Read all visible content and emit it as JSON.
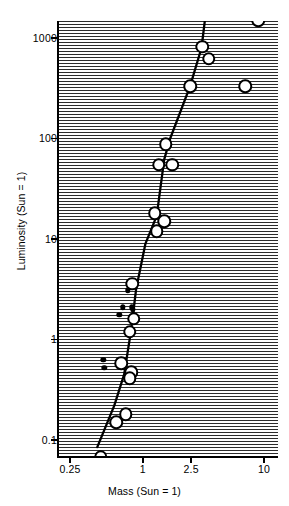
{
  "chart_data": {
    "type": "scatter",
    "title": "",
    "xlabel": "Mass (Sun = 1)",
    "ylabel": "Luminosity (Sun = 1)",
    "xscale": "log",
    "yscale": "log",
    "xlim": [
      0.2,
      12
    ],
    "ylim": [
      0.06,
      2600
    ],
    "grid": false,
    "legend": "none",
    "xticks": [
      {
        "value": 0.25,
        "label": "0.25"
      },
      {
        "value": 1,
        "label": "1"
      },
      {
        "value": 2.5,
        "label": "2.5"
      },
      {
        "value": 10,
        "label": "10"
      }
    ],
    "yticks": [
      {
        "value": 1000,
        "label": "1000"
      },
      {
        "value": 100,
        "label": "100"
      },
      {
        "value": 10,
        "label": "10"
      },
      {
        "value": 1,
        "label": "1"
      },
      {
        "value": 0.1,
        "label": "0.1"
      }
    ],
    "background": "horizontal-hatch",
    "marker_colors": {
      "open": "#ffffff",
      "outline": "#000000",
      "filled": "#000000",
      "fit_line": "#000000"
    },
    "series": [
      {
        "name": "open circles",
        "marker": "open-circle",
        "points": [
          [
            9.0,
            1500
          ],
          [
            3.1,
            820
          ],
          [
            3.5,
            620
          ],
          [
            2.45,
            330
          ],
          [
            7.0,
            330
          ],
          [
            1.55,
            88
          ],
          [
            1.35,
            55
          ],
          [
            1.75,
            55
          ],
          [
            1.25,
            18
          ],
          [
            1.5,
            15
          ],
          [
            1.3,
            12
          ],
          [
            0.82,
            3.6
          ],
          [
            0.84,
            1.6
          ],
          [
            0.78,
            1.2
          ],
          [
            0.66,
            0.58
          ],
          [
            0.8,
            0.47
          ],
          [
            0.78,
            0.41
          ],
          [
            0.72,
            0.18
          ],
          [
            0.6,
            0.15
          ],
          [
            0.45,
            0.068
          ]
        ]
      },
      {
        "name": "filled dots",
        "marker": "filled-circle",
        "points": [
          [
            0.75,
            3.1
          ],
          [
            0.68,
            2.1
          ],
          [
            0.81,
            2.1
          ],
          [
            0.83,
            2.0
          ],
          [
            0.64,
            1.75
          ],
          [
            0.47,
            0.63
          ],
          [
            0.48,
            0.52
          ]
        ]
      }
    ],
    "fit_line": {
      "name": "mass-luminosity relation",
      "points": [
        [
          0.42,
          0.085
        ],
        [
          0.58,
          0.22
        ],
        [
          0.7,
          0.45
        ],
        [
          0.8,
          1.25
        ],
        [
          0.88,
          3.2
        ],
        [
          1.05,
          9.0
        ],
        [
          1.3,
          17
        ],
        [
          1.5,
          62
        ],
        [
          1.68,
          100
        ],
        [
          2.45,
          330
        ],
        [
          3.05,
          800
        ],
        [
          3.25,
          1500
        ]
      ]
    }
  }
}
